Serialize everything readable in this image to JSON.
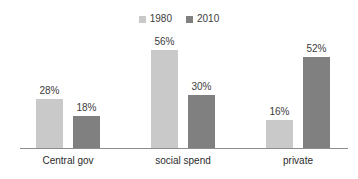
{
  "chart_data": {
    "type": "bar",
    "title": "",
    "xlabel": "",
    "ylabel": "",
    "ylim": [
      0,
      60
    ],
    "grid": false,
    "legend_position": "top-center",
    "categories": [
      "Central gov",
      "social spend",
      "private"
    ],
    "series": [
      {
        "name": "1980",
        "color": "#c9c9c9",
        "values": [
          28,
          56,
          16
        ],
        "labels": [
          "28%",
          "56%",
          "16%"
        ]
      },
      {
        "name": "2010",
        "color": "#808080",
        "values": [
          18,
          30,
          52
        ],
        "labels": [
          "18%",
          "30%",
          "52%"
        ]
      }
    ]
  },
  "legend": {
    "items": [
      {
        "label": "1980",
        "color": "#c9c9c9"
      },
      {
        "label": "2010",
        "color": "#808080"
      }
    ]
  },
  "axis": {
    "categories": [
      {
        "label": "Central gov",
        "center_x": 68
      },
      {
        "label": "social spend",
        "center_x": 183
      },
      {
        "label": "private",
        "center_x": 298
      }
    ]
  },
  "bars": [
    {
      "label": "28%",
      "value": 28,
      "series": "1980",
      "category": "Central gov",
      "x": 36,
      "height": 49,
      "color": "#c9c9c9"
    },
    {
      "label": "18%",
      "value": 18,
      "series": "2010",
      "category": "Central gov",
      "x": 73,
      "height": 32,
      "color": "#808080"
    },
    {
      "label": "56%",
      "value": 56,
      "series": "1980",
      "category": "social spend",
      "x": 151,
      "height": 98,
      "color": "#c9c9c9"
    },
    {
      "label": "30%",
      "value": 30,
      "series": "2010",
      "category": "social spend",
      "x": 188,
      "height": 53,
      "color": "#808080"
    },
    {
      "label": "16%",
      "value": 16,
      "series": "1980",
      "category": "private",
      "x": 266,
      "height": 28,
      "color": "#c9c9c9"
    },
    {
      "label": "52%",
      "value": 52,
      "series": "2010",
      "category": "private",
      "x": 303,
      "height": 91,
      "color": "#808080"
    }
  ]
}
